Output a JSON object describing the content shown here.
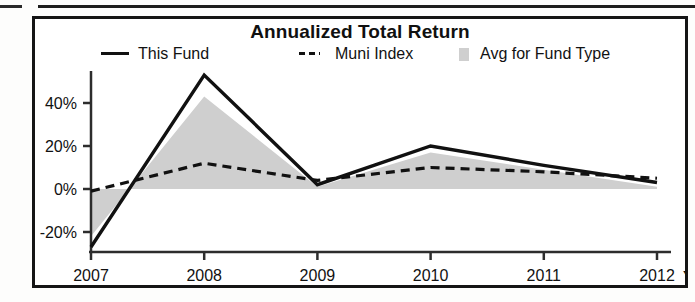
{
  "chart_data": {
    "type": "line",
    "title": "Annualized Total Return",
    "xlabel": "",
    "ylabel": "",
    "categories": [
      "2007",
      "2008",
      "2009",
      "2010",
      "2011",
      "2012"
    ],
    "x_axis_suffix_label": "YTD",
    "ylim": [
      -30,
      55
    ],
    "yticks": [
      -20,
      0,
      20,
      40
    ],
    "ytick_labels": [
      "-20%",
      "0%",
      "20%",
      "40%"
    ],
    "grid": false,
    "legend_position": "top",
    "series": [
      {
        "name": "This Fund",
        "style": "solid-line",
        "color": "#111111",
        "values": [
          -27,
          53,
          2,
          20,
          11,
          3
        ]
      },
      {
        "name": "Muni Index",
        "style": "dashed-line",
        "color": "#111111",
        "values": [
          -1,
          12,
          4,
          10,
          8,
          5
        ]
      },
      {
        "name": "Avg for Fund Type",
        "style": "filled-area",
        "color": "#cfcfcf",
        "values": [
          -22,
          43,
          1,
          17,
          9,
          1
        ]
      }
    ]
  },
  "legend": {
    "items": [
      {
        "label": "This Fund",
        "marker": "solid-line-marker"
      },
      {
        "label": "Muni Index",
        "marker": "dashed-line-marker"
      },
      {
        "label": "Avg for Fund Type",
        "marker": "area-swatch-marker"
      }
    ]
  },
  "colors": {
    "line": "#111111",
    "area_fill": "#cfcfcf",
    "frame": "#151515",
    "background": "#ffffff"
  }
}
